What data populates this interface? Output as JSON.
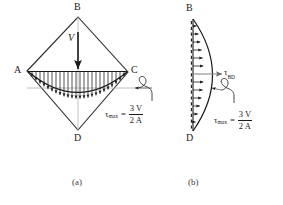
{
  "figure": {
    "title_present": false,
    "panels": [
      {
        "id": "a",
        "caption": "(a)",
        "shape": "diamond",
        "vertices": [
          {
            "name": "B",
            "label": "B",
            "position": "top"
          },
          {
            "name": "A",
            "label": "A",
            "position": "left"
          },
          {
            "name": "C",
            "label": "C",
            "position": "right"
          },
          {
            "name": "D",
            "label": "D",
            "position": "bottom"
          }
        ],
        "force_label": "V",
        "force_direction": "downward",
        "distribution": "parabolic shear stress along AC",
        "formula": {
          "symbol": "τ",
          "subscript": "max",
          "equals": "=",
          "numerator": "3 V",
          "denominator": "2 A",
          "plain": "τmax = 3V / 2A"
        }
      },
      {
        "id": "b",
        "caption": "(b)",
        "shape": "half-parabola on vertical axis BD",
        "vertices": [
          {
            "name": "B",
            "label": "B",
            "position": "top"
          },
          {
            "name": "D",
            "label": "D",
            "position": "bottom"
          }
        ],
        "axis_label": {
          "symbol": "τ",
          "subscript": "BD",
          "plain": "τBD"
        },
        "formula": {
          "symbol": "τ",
          "subscript": "max",
          "equals": "=",
          "numerator": "3 V",
          "denominator": "2 A",
          "plain": "τmax = 3V / 2A"
        }
      }
    ],
    "colors": {
      "line": "#1a1a1a",
      "guide": "#9b9b9b",
      "background": "#ffffff",
      "text": "#1a1a1a"
    }
  }
}
